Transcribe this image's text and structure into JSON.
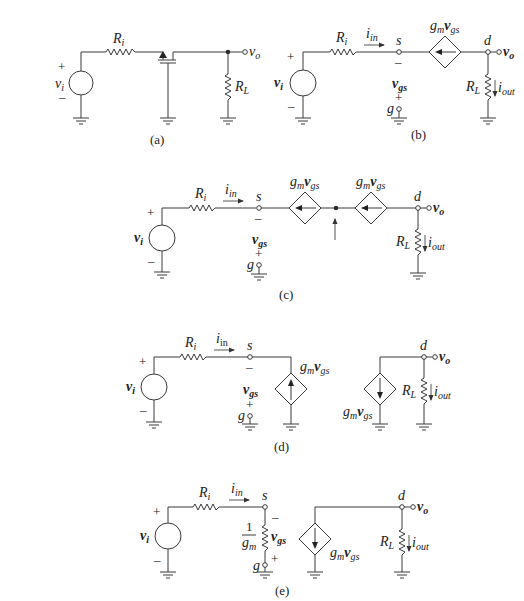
{
  "figure": {
    "panels": [
      {
        "id": "a",
        "caption": "(a)",
        "labels": {
          "source_voltage": "v",
          "source_voltage_sub": "i",
          "input_resistor": "R",
          "input_resistor_sub": "i",
          "load_resistor": "R",
          "load_resistor_sub": "L",
          "output": "v",
          "output_sub": "o",
          "plus": "+",
          "minus": "–"
        },
        "components": [
          "voltage-source",
          "input-resistor",
          "mosfet-common-gate",
          "load-resistor",
          "ground"
        ]
      },
      {
        "id": "b",
        "caption": "(b)",
        "labels": {
          "source_voltage": "v",
          "source_voltage_sub": "i",
          "input_resistor": "R",
          "input_resistor_sub": "i",
          "input_current": "i",
          "input_current_sub": "in",
          "source_node": "s",
          "drain_node": "d",
          "gate_node": "g",
          "dep_source": "g",
          "dep_source_m": "m",
          "dep_source_v": "v",
          "dep_source_sub": "gs",
          "vgs": "v",
          "vgs_sub": "gs",
          "load_resistor": "R",
          "load_resistor_sub": "L",
          "output_current": "i",
          "output_current_sub": "out",
          "output": "v",
          "output_sub": "o",
          "plus": "+",
          "minus": "–"
        }
      },
      {
        "id": "c",
        "caption": "(c)",
        "labels": {
          "source_voltage": "v",
          "source_voltage_sub": "i",
          "input_resistor": "R",
          "input_resistor_sub": "i",
          "input_current": "i",
          "input_current_sub": "in",
          "source_node": "s",
          "drain_node": "d",
          "gate_node": "g",
          "dep_source": "g",
          "dep_source_m": "m",
          "dep_source_v": "v",
          "dep_source_sub": "gs",
          "vgs": "v",
          "vgs_sub": "gs",
          "load_resistor": "R",
          "load_resistor_sub": "L",
          "output_current": "i",
          "output_current_sub": "out",
          "output": "v",
          "output_sub": "o",
          "plus": "+",
          "minus": "–"
        }
      },
      {
        "id": "d",
        "caption": "(d)",
        "labels": {
          "source_voltage": "v",
          "source_voltage_sub": "i",
          "input_resistor": "R",
          "input_resistor_sub": "i",
          "input_current": "i",
          "input_current_sub": "in",
          "source_node": "s",
          "drain_node": "d",
          "gate_node": "g",
          "dep_source": "g",
          "dep_source_m": "m",
          "dep_source_v": "v",
          "dep_source_sub": "gs",
          "vgs": "v",
          "vgs_sub": "gs",
          "load_resistor": "R",
          "load_resistor_sub": "L",
          "output_current": "i",
          "output_current_sub": "out",
          "output": "v",
          "output_sub": "o",
          "plus": "+",
          "minus": "–"
        }
      },
      {
        "id": "e",
        "caption": "(e)",
        "labels": {
          "source_voltage": "v",
          "source_voltage_sub": "i",
          "input_resistor": "R",
          "input_resistor_sub": "i",
          "input_current": "i",
          "input_current_sub": "in",
          "source_node": "s",
          "drain_node": "d",
          "gate_node": "g",
          "transconductance_resistor_num": "1",
          "transconductance_resistor_den": "g",
          "transconductance_resistor_den_sub": "m",
          "dep_source": "g",
          "dep_source_m": "m",
          "dep_source_v": "v",
          "dep_source_sub": "gs",
          "vgs": "v",
          "vgs_sub": "gs",
          "load_resistor": "R",
          "load_resistor_sub": "L",
          "output_current": "i",
          "output_current_sub": "out",
          "output": "v",
          "output_sub": "o",
          "plus": "+",
          "minus": "–"
        }
      }
    ]
  }
}
